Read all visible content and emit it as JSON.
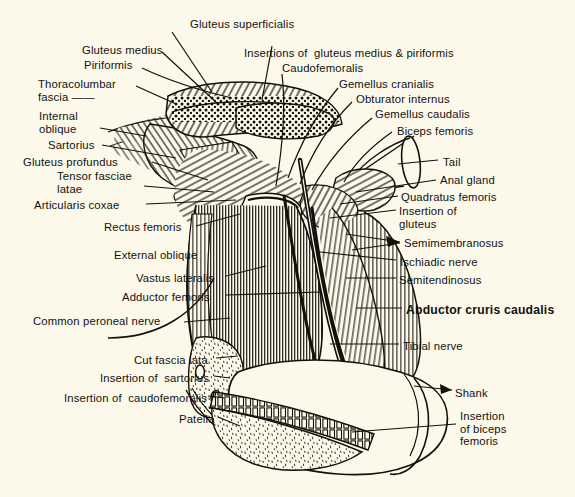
{
  "figure": {
    "kind": "anatomical-plate",
    "paper_color": "#fcf9ea",
    "ink_color": "#111111"
  },
  "labels": [
    {
      "id": "gluteus-superficialis",
      "text": "Gluteus superficialis",
      "x": 190,
      "y": 18,
      "align": "left",
      "emphasis": "normal"
    },
    {
      "id": "gluteus-medius",
      "text": "Gluteus medius",
      "x": 82,
      "y": 44,
      "align": "left",
      "emphasis": "normal"
    },
    {
      "id": "insertions-gluteus-medius-piriformis",
      "text": "Insertions of  gluteus medius & piriformis",
      "x": 244,
      "y": 47,
      "align": "left",
      "emphasis": "normal"
    },
    {
      "id": "piriformis",
      "text": "Piriformis",
      "x": 84,
      "y": 59,
      "align": "left",
      "emphasis": "normal"
    },
    {
      "id": "caudofemoralis",
      "text": "Caudofemoralis",
      "x": 282,
      "y": 62,
      "align": "left",
      "emphasis": "normal"
    },
    {
      "id": "thoracolumbar-fascia",
      "text": "Thoracolumbar\nfascia ——",
      "x": 38,
      "y": 78,
      "align": "left",
      "emphasis": "normal"
    },
    {
      "id": "gemellus-cranialis",
      "text": "Gemellus cranialis",
      "x": 339,
      "y": 78,
      "align": "left",
      "emphasis": "normal"
    },
    {
      "id": "obturator-internus",
      "text": "Obturator internus",
      "x": 356,
      "y": 93,
      "align": "left",
      "emphasis": "normal"
    },
    {
      "id": "internal-oblique",
      "text": "Internal\noblique",
      "x": 39,
      "y": 110,
      "align": "left",
      "emphasis": "normal"
    },
    {
      "id": "gemellus-caudalis",
      "text": "Gemellus caudalis",
      "x": 375,
      "y": 108,
      "align": "left",
      "emphasis": "normal"
    },
    {
      "id": "biceps-femoris",
      "text": "Biceps femoris",
      "x": 397,
      "y": 125,
      "align": "left",
      "emphasis": "normal"
    },
    {
      "id": "sartorius",
      "text": "Sartorius",
      "x": 48,
      "y": 139,
      "align": "left",
      "emphasis": "normal"
    },
    {
      "id": "gluteus-profundus",
      "text": "Gluteus profundus",
      "x": 23,
      "y": 156,
      "align": "left",
      "emphasis": "normal"
    },
    {
      "id": "tail",
      "text": "Tail",
      "x": 443,
      "y": 156,
      "align": "left",
      "emphasis": "normal"
    },
    {
      "id": "tensor-fasciae-latae",
      "text": "Tensor fasciae\nlatae",
      "x": 57,
      "y": 170,
      "align": "left",
      "emphasis": "normal"
    },
    {
      "id": "anal-gland",
      "text": "Anal gland",
      "x": 440,
      "y": 174,
      "align": "left",
      "emphasis": "normal"
    },
    {
      "id": "quadratus-femoris",
      "text": "Quadratus femoris",
      "x": 401,
      "y": 191,
      "align": "left",
      "emphasis": "normal"
    },
    {
      "id": "articularis-coxae",
      "text": "Articularis coxae",
      "x": 34,
      "y": 199,
      "align": "left",
      "emphasis": "normal"
    },
    {
      "id": "insertion-of-gluteus",
      "text": "Insertion of\ngluteus",
      "x": 399,
      "y": 205,
      "align": "left",
      "emphasis": "normal"
    },
    {
      "id": "rectus-femoris",
      "text": "Rectus femoris",
      "x": 104,
      "y": 221,
      "align": "left",
      "emphasis": "normal"
    },
    {
      "id": "semimembranosus",
      "text": "Semimembranosus",
      "x": 404,
      "y": 237,
      "align": "left",
      "emphasis": "normal"
    },
    {
      "id": "external-oblique",
      "text": "External oblique",
      "x": 114,
      "y": 249,
      "align": "left",
      "emphasis": "normal"
    },
    {
      "id": "ischiadic-nerve",
      "text": "Ischiadic nerve",
      "x": 400,
      "y": 256,
      "align": "left",
      "emphasis": "normal"
    },
    {
      "id": "vastus-lateralis",
      "text": "Vastus lateralis",
      "x": 136,
      "y": 272,
      "align": "left",
      "emphasis": "normal"
    },
    {
      "id": "semitendinosus",
      "text": "Semitendinosus",
      "x": 399,
      "y": 274,
      "align": "left",
      "emphasis": "normal"
    },
    {
      "id": "adductor femoris",
      "text": "Adductor femoris",
      "x": 122,
      "y": 291,
      "align": "left",
      "emphasis": "normal"
    },
    {
      "id": "abductor-cruris-caudalis",
      "text": "Abductor cruris caudalis",
      "x": 406,
      "y": 304,
      "align": "left",
      "emphasis": "bold"
    },
    {
      "id": "common-peroneal-nerve",
      "text": "Common peroneal nerve",
      "x": 33,
      "y": 315,
      "align": "left",
      "emphasis": "normal"
    },
    {
      "id": "tibial-nerve",
      "text": "Tibial nerve",
      "x": 403,
      "y": 340,
      "align": "left",
      "emphasis": "normal"
    },
    {
      "id": "cut-fascia-lata",
      "text": "Cut fascia lata",
      "x": 134,
      "y": 354,
      "align": "left",
      "emphasis": "normal"
    },
    {
      "id": "insertion-of-sartorius",
      "text": "Insertion of  sartorius",
      "x": 100,
      "y": 372,
      "align": "left",
      "emphasis": "normal"
    },
    {
      "id": "shank",
      "text": "Shank",
      "x": 455,
      "y": 387,
      "align": "left",
      "emphasis": "normal"
    },
    {
      "id": "insertion-of-caudofemoralis",
      "text": "Insertion of  caudofemoralis",
      "x": 64,
      "y": 392,
      "align": "left",
      "emphasis": "normal"
    },
    {
      "id": "insertion-of-biceps-femoris",
      "text": "Insertion\nof biceps\nfemoris",
      "x": 460,
      "y": 410,
      "align": "left",
      "emphasis": "normal"
    },
    {
      "id": "patella",
      "text": "Patella",
      "x": 179,
      "y": 413,
      "align": "left",
      "emphasis": "normal"
    }
  ]
}
